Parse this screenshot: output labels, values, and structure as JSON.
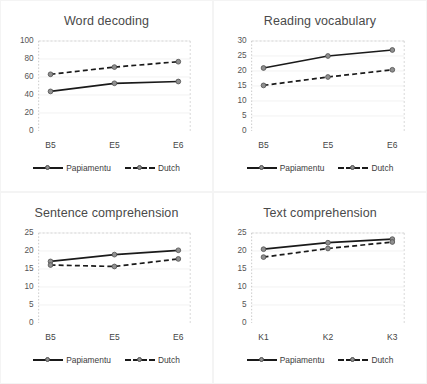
{
  "figure": {
    "background": "#ffffff",
    "panel_border_color": "#f4f4f4",
    "series_colors": {
      "papiamentu_line": "#1a1a1a",
      "dutch_line": "#1a1a1a",
      "marker_fill": "#8f8f8f",
      "marker_edge": "#4d4d4d"
    },
    "axis_text_color": "#555555",
    "title_color": "#4a4a4a",
    "gridline_color": "#efefef",
    "plot_border_color": "#cfcfcf"
  },
  "legend": {
    "papiamentu_label": "Papiamentu",
    "dutch_label": "Dutch",
    "position": "below-axis-centered"
  },
  "chart_data": [
    {
      "type": "line",
      "title": "Word decoding",
      "xlabel": "",
      "ylabel": "",
      "categories": [
        "B5",
        "E5",
        "E6"
      ],
      "ylim": [
        0,
        100
      ],
      "yticks": [
        0,
        20,
        40,
        60,
        80,
        100
      ],
      "grid": true,
      "legend": [
        "Papiamentu",
        "Dutch"
      ],
      "series": [
        {
          "name": "Papiamentu",
          "style": "solid",
          "values": [
            44,
            53,
            55
          ]
        },
        {
          "name": "Dutch",
          "style": "dashed",
          "values": [
            63,
            71,
            77
          ]
        }
      ]
    },
    {
      "type": "line",
      "title": "Reading vocabulary",
      "xlabel": "",
      "ylabel": "",
      "categories": [
        "B5",
        "E5",
        "E6"
      ],
      "ylim": [
        0,
        30
      ],
      "yticks": [
        0,
        5,
        10,
        15,
        20,
        25,
        30
      ],
      "grid": true,
      "legend": [
        "Papiamentu",
        "Dutch"
      ],
      "series": [
        {
          "name": "Papiamentu",
          "style": "solid",
          "values": [
            21,
            25,
            27
          ]
        },
        {
          "name": "Dutch",
          "style": "dashed",
          "values": [
            15.2,
            18,
            20.4
          ]
        }
      ]
    },
    {
      "type": "line",
      "title": "Sentence comprehension",
      "xlabel": "",
      "ylabel": "",
      "categories": [
        "B5",
        "E5",
        "E6"
      ],
      "ylim": [
        0,
        25
      ],
      "yticks": [
        0,
        5,
        10,
        15,
        20,
        25
      ],
      "grid": true,
      "legend": [
        "Papiamentu",
        "Dutch"
      ],
      "series": [
        {
          "name": "Papiamentu",
          "style": "solid",
          "values": [
            17.1,
            19,
            20.2
          ]
        },
        {
          "name": "Dutch",
          "style": "dashed",
          "values": [
            16.1,
            15.7,
            17.8
          ]
        }
      ]
    },
    {
      "type": "line",
      "title": "Text comprehension",
      "xlabel": "",
      "ylabel": "",
      "categories": [
        "K1",
        "K2",
        "K3"
      ],
      "ylim": [
        0,
        25
      ],
      "yticks": [
        0,
        5,
        10,
        15,
        20,
        25
      ],
      "grid": true,
      "legend": [
        "Papiamentu",
        "Dutch"
      ],
      "series": [
        {
          "name": "Papiamentu",
          "style": "solid",
          "values": [
            20.5,
            22.3,
            23.3
          ]
        },
        {
          "name": "Dutch",
          "style": "dashed",
          "values": [
            18.3,
            20.7,
            22.5
          ]
        }
      ]
    }
  ]
}
